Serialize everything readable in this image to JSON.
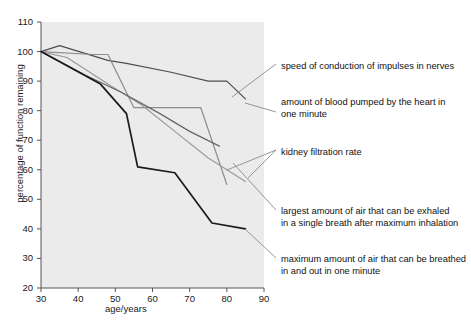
{
  "chart_data": {
    "type": "line",
    "title": "",
    "xlabel": "age/years",
    "ylabel": "percentage of function remaining",
    "xlim": [
      30,
      90
    ],
    "ylim": [
      20,
      110
    ],
    "xticks": [
      30,
      40,
      50,
      60,
      70,
      80,
      90
    ],
    "yticks": [
      20,
      30,
      40,
      50,
      60,
      70,
      80,
      90,
      100,
      110
    ],
    "grid": false,
    "legend_position": "right-callout-labels",
    "plot_background": "#ebebeb",
    "series": [
      {
        "name": "speed of conduction of impulses in nerves",
        "color": "#4d4d4d",
        "x": [
          30,
          35,
          48,
          53,
          65,
          75,
          80,
          85
        ],
        "y": [
          100,
          102,
          97,
          96,
          93,
          90,
          90,
          84
        ]
      },
      {
        "name": "amount of blood pumped by the heart in one minute",
        "color": "#8c8c8c",
        "x": [
          30,
          44,
          48,
          55,
          66,
          73,
          80
        ],
        "y": [
          100,
          99,
          99,
          81,
          81,
          81,
          55
        ]
      },
      {
        "name": "kidney filtration rate",
        "color": "#9a9a9a",
        "x": [
          30,
          37,
          48,
          57,
          66,
          75,
          85
        ],
        "y": [
          100,
          98,
          89,
          82,
          73,
          64,
          56
        ]
      },
      {
        "name": "largest amount of air that can be exhaled in a single breath after maximum inhalation",
        "color": "#666666",
        "x": [
          30,
          42,
          52,
          62,
          70,
          78
        ],
        "y": [
          100,
          92,
          86,
          79,
          73,
          68
        ]
      },
      {
        "name": "maximum amount of air that can be breathed in and out in one minute",
        "color": "#1a1a1a",
        "x": [
          30,
          46,
          53,
          56,
          66,
          76,
          85
        ],
        "y": [
          100,
          89,
          79,
          61,
          59,
          42,
          40
        ]
      }
    ],
    "annotations": [
      {
        "id": "annotation-nerve-conduction",
        "text": "speed of conduction of impulses in nerves",
        "x_px": 281,
        "y_px": 61
      },
      {
        "id": "annotation-blood-pumped",
        "text": "amount of blood pumped by the heart in\none minute",
        "x_px": 281,
        "y_px": 97
      },
      {
        "id": "annotation-kidney-filtration",
        "text": "kidney filtration rate",
        "x_px": 281,
        "y_px": 147
      },
      {
        "id": "annotation-air-exhaled",
        "text": "largest amount of air that can be exhaled\nin a single breath after maximum inhalation",
        "x_px": 281,
        "y_px": 206
      },
      {
        "id": "annotation-air-breathed",
        "text": "maximum amount of air that can be breathed\nin and out in one minute",
        "x_px": 281,
        "y_px": 254
      }
    ],
    "callout_lines": [
      {
        "x1": 232,
        "y1": 97,
        "x2": 276,
        "y2": 64
      },
      {
        "x1": 245,
        "y1": 103,
        "x2": 276,
        "y2": 112
      },
      {
        "x1": 227,
        "y1": 170,
        "x2": 276,
        "y2": 150
      },
      {
        "x1": 248,
        "y1": 178,
        "x2": 276,
        "y2": 150
      },
      {
        "x1": 233,
        "y1": 163,
        "x2": 276,
        "y2": 210
      },
      {
        "x1": 245,
        "y1": 229,
        "x2": 276,
        "y2": 258
      }
    ]
  }
}
